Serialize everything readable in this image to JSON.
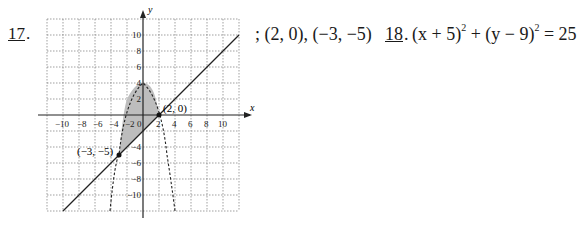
{
  "problem17": {
    "number": "17",
    "answer": "; (2, 0), (−3, −5)",
    "graph": {
      "x_label": "x",
      "y_label": "y",
      "x_ticks": [
        "−10",
        "−8",
        "−6",
        "−4",
        "−2",
        "0",
        "2",
        "4",
        "6",
        "8",
        "10"
      ],
      "y_ticks": [
        "10",
        "8",
        "6",
        "4",
        "2",
        "−2",
        "−4",
        "−6",
        "−8",
        "−10"
      ],
      "point_labels": [
        "(2, 0)",
        "(−3, −5)"
      ],
      "line_equation": "y = x − 2",
      "parabola_equation": "y = 4 − x² (dashed)",
      "shaded_region": "between line and parabola"
    }
  },
  "problem18": {
    "number": "18",
    "lhs1": "(x + 5)",
    "exp1": "2",
    "plus": " + ",
    "lhs2": "(y − 9)",
    "exp2": "2",
    "rhs": " = 25"
  }
}
